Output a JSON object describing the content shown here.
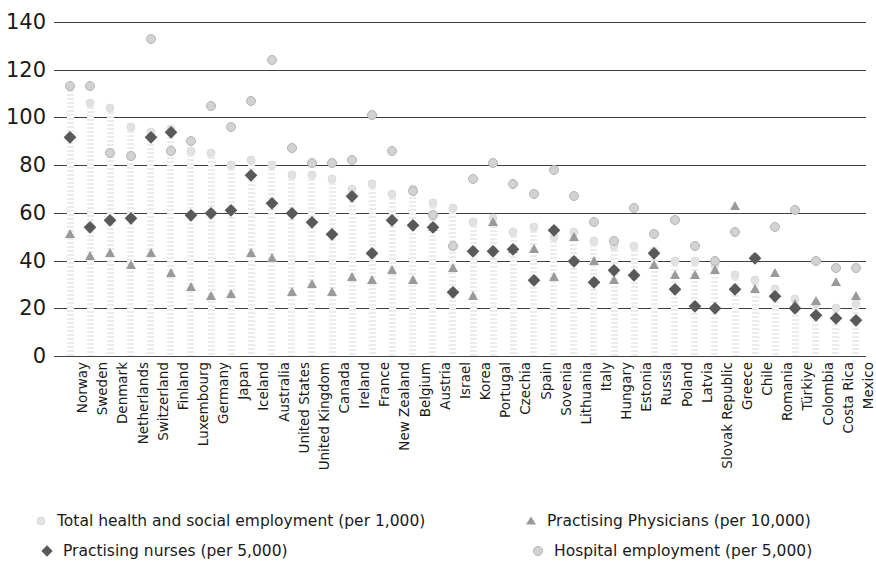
{
  "chart_data": {
    "type": "scatter",
    "title": "",
    "xlabel": "",
    "ylabel": "",
    "ylim": [
      0,
      140
    ],
    "grid": true,
    "legend_position": "bottom",
    "y_ticks": [
      0,
      20,
      40,
      60,
      80,
      100,
      120,
      140
    ],
    "categories": [
      "Norway",
      "Sweden",
      "Denmark",
      "Netherlands",
      "Switzerland",
      "Finland",
      "Luxembourg",
      "Germany",
      "Japan",
      "Iceland",
      "Australia",
      "United States",
      "United Kingdom",
      "Canada",
      "Ireland",
      "France",
      "New Zealand",
      "Belgium",
      "Austria",
      "Israel",
      "Korea",
      "Portugal",
      "Czechia",
      "Spain",
      "Sovenia",
      "Lithuania",
      "Italy",
      "Hungary",
      "Estonia",
      "Russia",
      "Poland",
      "Latvia",
      "Slovak Republic",
      "Greece",
      "Chile",
      "Romania",
      "Türkiye",
      "Colombia",
      "Costa Rica",
      "Mexico"
    ],
    "series": [
      {
        "name": "Total health and social employment (per 1,000)",
        "marker": "small-circle",
        "color": "#e2e2e2",
        "values": [
          113,
          106,
          104,
          96,
          94,
          95,
          86,
          85,
          80,
          82,
          80,
          76,
          76,
          74,
          70,
          72,
          68,
          70,
          64,
          62,
          56,
          58,
          52,
          54,
          50,
          52,
          48,
          46,
          46,
          44,
          40,
          40,
          38,
          34,
          32,
          28,
          24,
          22,
          20,
          22
        ]
      },
      {
        "name": "Practising Physicians (per 10,000)",
        "marker": "triangle",
        "color": "#9a9a9a",
        "values": [
          51,
          42,
          43,
          38,
          43,
          35,
          29,
          25,
          26,
          43,
          41,
          27,
          30,
          27,
          33,
          32,
          36,
          32,
          54,
          37,
          25,
          56,
          45,
          45,
          33,
          50,
          40,
          32,
          35,
          38,
          34,
          34,
          36,
          63,
          28,
          35,
          22,
          23,
          31,
          25
        ]
      },
      {
        "name": "Practising nurses (per 5,000)",
        "marker": "diamond",
        "color": "#595959",
        "values": [
          92,
          54,
          57,
          58,
          92,
          94,
          59,
          60,
          61,
          76,
          64,
          60,
          56,
          51,
          67,
          43,
          57,
          55,
          54,
          27,
          44,
          44,
          45,
          32,
          53,
          40,
          31,
          36,
          34,
          43,
          28,
          21,
          20,
          28,
          41,
          25,
          20,
          17,
          16,
          15
        ]
      },
      {
        "name": "Hospital employment (per 5,000)",
        "marker": "circle",
        "color": "#d2d2d2",
        "values": [
          113,
          113,
          85,
          84,
          133,
          86,
          90,
          105,
          96,
          107,
          124,
          87,
          81,
          81,
          82,
          101,
          86,
          69,
          59,
          46,
          74,
          81,
          72,
          68,
          78,
          67,
          56,
          48,
          62,
          51,
          57,
          46,
          40,
          52,
          41,
          54,
          61,
          40,
          37,
          37
        ]
      }
    ]
  },
  "legend": {
    "items": [
      {
        "label": "Total health and social employment (per 1,000)",
        "marker": "small-circle-icon"
      },
      {
        "label": "Practising Physicians (per 10,000)",
        "marker": "triangle-icon"
      },
      {
        "label": "Practising nurses (per 5,000)",
        "marker": "diamond-icon"
      },
      {
        "label": "Hospital employment (per 5,000)",
        "marker": "circle-icon"
      }
    ]
  }
}
